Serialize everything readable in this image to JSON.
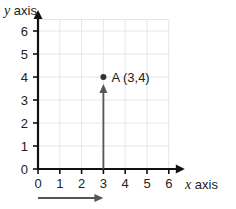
{
  "chart_data": {
    "type": "scatter",
    "title": "",
    "xlabel_var": "x",
    "xlabel_text": " axis",
    "ylabel_var": "y",
    "ylabel_text": " axis",
    "xlim": [
      0,
      6
    ],
    "ylim": [
      0,
      6
    ],
    "x_ticks": [
      "0",
      "1",
      "2",
      "3",
      "4",
      "5",
      "6"
    ],
    "y_ticks": [
      "0",
      "1",
      "2",
      "3",
      "4",
      "5",
      "6"
    ],
    "grid": true,
    "points": [
      {
        "name": "A",
        "x": 3,
        "y": 4,
        "label": "A (3,4)"
      }
    ],
    "movement_arrows": [
      {
        "direction": "horizontal",
        "from": 0,
        "to": 3,
        "description": "move 3 along x axis"
      },
      {
        "direction": "vertical",
        "from": 0,
        "to": 4,
        "at_x": 3,
        "description": "move 4 up y axis"
      }
    ],
    "colors": {
      "axis": "#111111",
      "grid": "#e6e6e6",
      "arrow": "#555555",
      "point": "#333333"
    }
  }
}
